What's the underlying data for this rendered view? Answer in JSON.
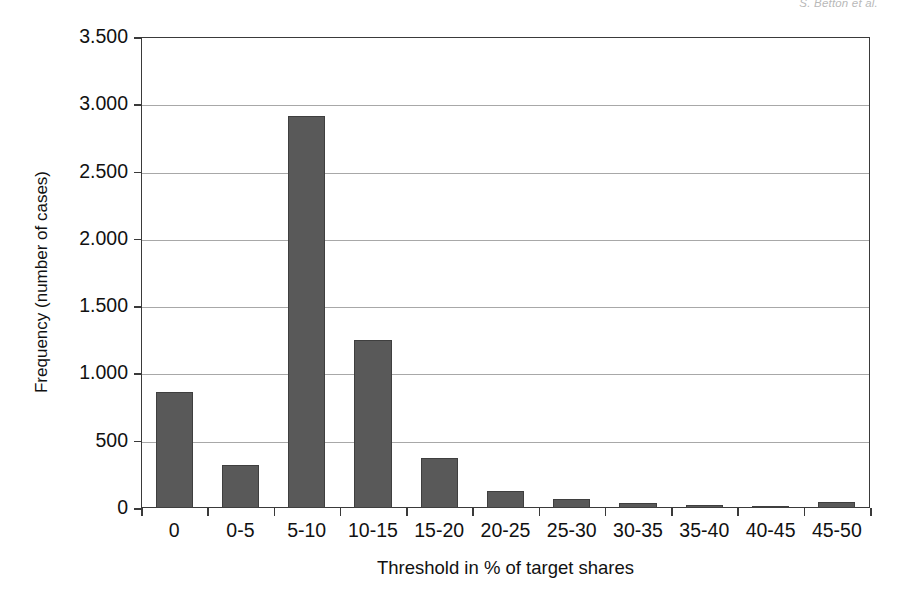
{
  "header": {
    "running_head": "S. Betton et al."
  },
  "chart_data": {
    "type": "bar",
    "title": "",
    "xlabel": "Threshold in % of target shares",
    "ylabel": "Frequency (number of cases)",
    "categories": [
      "0",
      "0-5",
      "5-10",
      "10-15",
      "15-20",
      "20-25",
      "25-30",
      "30-35",
      "35-40",
      "40-45",
      "45-50"
    ],
    "values": [
      860,
      320,
      2915,
      1245,
      370,
      125,
      65,
      40,
      25,
      12,
      45
    ],
    "ylim": [
      0,
      3500
    ],
    "ytick_values": [
      0,
      500,
      1000,
      1500,
      2000,
      2500,
      3000,
      3500
    ],
    "ytick_labels": [
      "0",
      "500",
      "1.000",
      "1.500",
      "2.000",
      "2.500",
      "3.000",
      "3.500"
    ],
    "grid": true,
    "grid_axis": "y",
    "legend": null,
    "bar_color": "#595959",
    "bar_edge_color": "#3f3f3f",
    "axis_color": "#3a3a3a",
    "grid_color": "#a8a8a8",
    "background_color": "#ffffff"
  }
}
